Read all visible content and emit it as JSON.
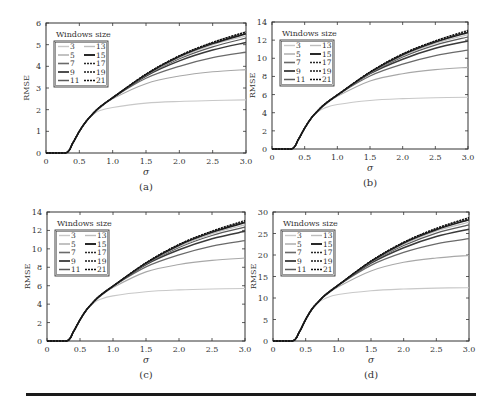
{
  "figure": {
    "legend_title": "Windows size",
    "panels": [
      "a",
      "b",
      "c",
      "d"
    ]
  },
  "chart_data": [
    {
      "type": "line",
      "panel_label": "(a)",
      "title": "",
      "xlabel": "σ",
      "ylabel": "RMSE",
      "xlim": [
        0,
        3.0
      ],
      "ylim": [
        0,
        6
      ],
      "xticks": [
        "0",
        "0.5",
        "1.0",
        "1.5",
        "2.0",
        "2.5",
        "3.0"
      ],
      "yticks": [
        "0",
        "1",
        "2",
        "3",
        "4",
        "5",
        "6"
      ],
      "legend_title": "Windows size",
      "legend_position": "upper-left",
      "x": [
        0,
        0.3,
        0.4,
        0.5,
        0.6,
        0.7,
        0.8,
        1.0,
        1.5,
        2.0,
        2.5,
        3.0
      ],
      "series": [
        {
          "name": "3",
          "values": [
            0,
            0,
            0.45,
            1.0,
            1.45,
            1.75,
            1.95,
            2.1,
            2.3,
            2.38,
            2.42,
            2.45
          ]
        },
        {
          "name": "5",
          "values": [
            0,
            0,
            0.45,
            1.0,
            1.45,
            1.8,
            2.05,
            2.5,
            3.2,
            3.55,
            3.75,
            3.85
          ]
        },
        {
          "name": "7",
          "values": [
            0,
            0,
            0.45,
            1.0,
            1.45,
            1.8,
            2.1,
            2.55,
            3.45,
            4.0,
            4.4,
            4.65
          ]
        },
        {
          "name": "9",
          "values": [
            0,
            0,
            0.45,
            1.0,
            1.45,
            1.8,
            2.1,
            2.55,
            3.55,
            4.25,
            4.75,
            5.1
          ]
        },
        {
          "name": "11",
          "values": [
            0,
            0,
            0.45,
            1.0,
            1.45,
            1.8,
            2.1,
            2.55,
            3.58,
            4.35,
            4.9,
            5.3
          ]
        },
        {
          "name": "13",
          "values": [
            0,
            0,
            0.45,
            1.0,
            1.45,
            1.8,
            2.1,
            2.55,
            3.6,
            4.4,
            5.0,
            5.4
          ]
        },
        {
          "name": "15",
          "values": [
            0,
            0,
            0.45,
            1.0,
            1.45,
            1.8,
            2.1,
            2.55,
            3.62,
            4.45,
            5.05,
            5.5
          ]
        },
        {
          "name": "17",
          "values": [
            0,
            0,
            0.45,
            1.0,
            1.45,
            1.8,
            2.1,
            2.55,
            3.63,
            4.47,
            5.08,
            5.55
          ]
        },
        {
          "name": "19",
          "values": [
            0,
            0,
            0.45,
            1.0,
            1.45,
            1.8,
            2.1,
            2.55,
            3.64,
            4.48,
            5.1,
            5.58
          ]
        },
        {
          "name": "21",
          "values": [
            0,
            0,
            0.45,
            1.0,
            1.45,
            1.8,
            2.1,
            2.55,
            3.65,
            4.5,
            5.12,
            5.6
          ]
        }
      ]
    },
    {
      "type": "line",
      "panel_label": "(b)",
      "title": "",
      "xlabel": "σ",
      "ylabel": "RMSE",
      "xlim": [
        0,
        3.0
      ],
      "ylim": [
        0,
        14
      ],
      "xticks": [
        "0",
        "0.5",
        "1.0",
        "1.5",
        "2.0",
        "2.5",
        "3.0"
      ],
      "yticks": [
        "0",
        "2",
        "4",
        "6",
        "8",
        "10",
        "12",
        "14"
      ],
      "legend_title": "Windows size",
      "legend_position": "upper-left",
      "x": [
        0,
        0.3,
        0.4,
        0.5,
        0.6,
        0.7,
        0.8,
        1.0,
        1.5,
        2.0,
        2.5,
        3.0
      ],
      "series": [
        {
          "name": "3",
          "values": [
            0,
            0,
            1.0,
            2.3,
            3.4,
            4.1,
            4.5,
            4.9,
            5.35,
            5.55,
            5.65,
            5.7
          ]
        },
        {
          "name": "5",
          "values": [
            0,
            0,
            1.0,
            2.3,
            3.4,
            4.2,
            4.8,
            5.8,
            7.5,
            8.3,
            8.75,
            9.0
          ]
        },
        {
          "name": "7",
          "values": [
            0,
            0,
            1.0,
            2.3,
            3.4,
            4.2,
            4.9,
            5.95,
            8.05,
            9.35,
            10.3,
            10.9
          ]
        },
        {
          "name": "9",
          "values": [
            0,
            0,
            1.0,
            2.3,
            3.4,
            4.2,
            4.9,
            5.95,
            8.3,
            9.9,
            11.1,
            11.9
          ]
        },
        {
          "name": "11",
          "values": [
            0,
            0,
            1.0,
            2.3,
            3.4,
            4.2,
            4.9,
            5.95,
            8.35,
            10.15,
            11.45,
            12.35
          ]
        },
        {
          "name": "13",
          "values": [
            0,
            0,
            1.0,
            2.3,
            3.4,
            4.2,
            4.9,
            5.95,
            8.4,
            10.25,
            11.65,
            12.6
          ]
        },
        {
          "name": "15",
          "values": [
            0,
            0,
            1.0,
            2.3,
            3.4,
            4.2,
            4.9,
            5.95,
            8.45,
            10.4,
            11.8,
            12.85
          ]
        },
        {
          "name": "17",
          "values": [
            0,
            0,
            1.0,
            2.3,
            3.4,
            4.2,
            4.9,
            5.95,
            8.47,
            10.45,
            11.85,
            12.95
          ]
        },
        {
          "name": "19",
          "values": [
            0,
            0,
            1.0,
            2.3,
            3.4,
            4.2,
            4.9,
            5.95,
            8.49,
            10.48,
            11.9,
            13.0
          ]
        },
        {
          "name": "21",
          "values": [
            0,
            0,
            1.0,
            2.3,
            3.4,
            4.2,
            4.9,
            5.95,
            8.5,
            10.5,
            11.95,
            13.1
          ]
        }
      ]
    },
    {
      "type": "line",
      "panel_label": "(c)",
      "title": "",
      "xlabel": "σ",
      "ylabel": "RMSE",
      "xlim": [
        0,
        3.0
      ],
      "ylim": [
        0,
        14
      ],
      "xticks": [
        "0",
        "0.5",
        "1.0",
        "1.5",
        "2.0",
        "2.5",
        "3.0"
      ],
      "yticks": [
        "0",
        "2",
        "4",
        "6",
        "8",
        "10",
        "12",
        "14"
      ],
      "legend_title": "Windows size",
      "legend_position": "upper-left",
      "x": [
        0,
        0.3,
        0.4,
        0.5,
        0.6,
        0.7,
        0.8,
        1.0,
        1.5,
        2.0,
        2.5,
        3.0
      ],
      "series": [
        {
          "name": "3",
          "values": [
            0,
            0,
            1.0,
            2.3,
            3.4,
            4.1,
            4.5,
            4.9,
            5.35,
            5.55,
            5.65,
            5.7
          ]
        },
        {
          "name": "5",
          "values": [
            0,
            0,
            1.0,
            2.3,
            3.4,
            4.2,
            4.8,
            5.8,
            7.5,
            8.3,
            8.75,
            9.0
          ]
        },
        {
          "name": "7",
          "values": [
            0,
            0,
            1.0,
            2.3,
            3.4,
            4.2,
            4.9,
            5.95,
            8.05,
            9.35,
            10.3,
            10.9
          ]
        },
        {
          "name": "9",
          "values": [
            0,
            0,
            1.0,
            2.3,
            3.4,
            4.2,
            4.9,
            5.95,
            8.3,
            9.9,
            11.1,
            11.9
          ]
        },
        {
          "name": "11",
          "values": [
            0,
            0,
            1.0,
            2.3,
            3.4,
            4.2,
            4.9,
            5.95,
            8.35,
            10.15,
            11.45,
            12.35
          ]
        },
        {
          "name": "13",
          "values": [
            0,
            0,
            1.0,
            2.3,
            3.4,
            4.2,
            4.9,
            5.95,
            8.4,
            10.25,
            11.65,
            12.6
          ]
        },
        {
          "name": "15",
          "values": [
            0,
            0,
            1.0,
            2.3,
            3.4,
            4.2,
            4.9,
            5.95,
            8.45,
            10.4,
            11.8,
            12.85
          ]
        },
        {
          "name": "17",
          "values": [
            0,
            0,
            1.0,
            2.3,
            3.4,
            4.2,
            4.9,
            5.95,
            8.47,
            10.45,
            11.85,
            12.95
          ]
        },
        {
          "name": "19",
          "values": [
            0,
            0,
            1.0,
            2.3,
            3.4,
            4.2,
            4.9,
            5.95,
            8.49,
            10.48,
            11.9,
            13.0
          ]
        },
        {
          "name": "21",
          "values": [
            0,
            0,
            1.0,
            2.3,
            3.4,
            4.2,
            4.9,
            5.95,
            8.5,
            10.5,
            11.95,
            13.1
          ]
        }
      ]
    },
    {
      "type": "line",
      "panel_label": "(d)",
      "title": "",
      "xlabel": "σ",
      "ylabel": "RMSE",
      "xlim": [
        0,
        3.0
      ],
      "ylim": [
        0,
        30
      ],
      "xticks": [
        "0",
        "0.5",
        "1.0",
        "1.5",
        "2.0",
        "2.5",
        "3.0"
      ],
      "yticks": [
        "0",
        "5",
        "10",
        "15",
        "20",
        "25",
        "30"
      ],
      "legend_title": "Windows size",
      "legend_position": "upper-left",
      "x": [
        0,
        0.3,
        0.4,
        0.5,
        0.6,
        0.7,
        0.8,
        1.0,
        1.5,
        2.0,
        2.5,
        3.0
      ],
      "series": [
        {
          "name": "3",
          "values": [
            0,
            0,
            2.0,
            5.0,
            7.5,
            9.0,
            9.9,
            10.8,
            11.7,
            12.1,
            12.3,
            12.4
          ]
        },
        {
          "name": "5",
          "values": [
            0,
            0,
            2.0,
            5.0,
            7.5,
            9.2,
            10.5,
            12.6,
            16.3,
            18.3,
            19.3,
            19.9
          ]
        },
        {
          "name": "7",
          "values": [
            0,
            0,
            2.0,
            5.0,
            7.5,
            9.2,
            10.7,
            13.0,
            17.6,
            20.6,
            22.6,
            23.8
          ]
        },
        {
          "name": "9",
          "values": [
            0,
            0,
            2.0,
            5.0,
            7.5,
            9.2,
            10.7,
            13.0,
            18.1,
            21.7,
            24.3,
            26.0
          ]
        },
        {
          "name": "11",
          "values": [
            0,
            0,
            2.0,
            5.0,
            7.5,
            9.2,
            10.7,
            13.0,
            18.3,
            22.2,
            25.1,
            27.0
          ]
        },
        {
          "name": "13",
          "values": [
            0,
            0,
            2.0,
            5.0,
            7.5,
            9.2,
            10.7,
            13.0,
            18.4,
            22.5,
            25.6,
            27.6
          ]
        },
        {
          "name": "15",
          "values": [
            0,
            0,
            2.0,
            5.0,
            7.5,
            9.2,
            10.7,
            13.0,
            18.5,
            22.8,
            25.9,
            28.2
          ]
        },
        {
          "name": "17",
          "values": [
            0,
            0,
            2.0,
            5.0,
            7.5,
            9.2,
            10.7,
            13.0,
            18.55,
            22.9,
            26.05,
            28.45
          ]
        },
        {
          "name": "19",
          "values": [
            0,
            0,
            2.0,
            5.0,
            7.5,
            9.2,
            10.7,
            13.0,
            18.6,
            22.95,
            26.15,
            28.6
          ]
        },
        {
          "name": "21",
          "values": [
            0,
            0,
            2.0,
            5.0,
            7.5,
            9.2,
            10.7,
            13.0,
            18.65,
            23.0,
            26.25,
            28.75
          ]
        }
      ]
    }
  ],
  "series_style": {
    "3": {
      "color": "#c8c8c8",
      "width": 1.1,
      "dash": ""
    },
    "5": {
      "color": "#a8a8a8",
      "width": 1.1,
      "dash": ""
    },
    "7": {
      "color": "#6a6a6a",
      "width": 1.3,
      "dash": ""
    },
    "9": {
      "color": "#3a3a3a",
      "width": 1.5,
      "dash": ""
    },
    "11": {
      "color": "#5a5a5a",
      "width": 1.2,
      "dash": ""
    },
    "13": {
      "color": "#bdbdbd",
      "width": 1.1,
      "dash": ""
    },
    "15": {
      "color": "#1e1e1e",
      "width": 1.6,
      "dash": ""
    },
    "17": {
      "color": "#2a2a2a",
      "width": 1.1,
      "dash": "2,1"
    },
    "19": {
      "color": "#1a1a1a",
      "width": 1.3,
      "dash": "2,1"
    },
    "21": {
      "color": "#111111",
      "width": 1.0,
      "dash": "2,1"
    }
  },
  "layout": {
    "panels": [
      {
        "left": 46,
        "top": 23,
        "right": 246,
        "bottom": 153
      },
      {
        "left": 272,
        "top": 22,
        "right": 468,
        "bottom": 149
      },
      {
        "left": 47,
        "top": 212,
        "right": 245,
        "bottom": 341
      },
      {
        "left": 273,
        "top": 212,
        "right": 469,
        "bottom": 341
      }
    ]
  }
}
